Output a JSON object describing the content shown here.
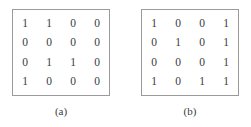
{
  "figure": {
    "panels": [
      {
        "id": "panel-a",
        "caption": "(a)",
        "matrix": [
          [
            "1",
            "1",
            "0",
            "0"
          ],
          [
            "0",
            "0",
            "0",
            "0"
          ],
          [
            "0",
            "1",
            "1",
            "0"
          ],
          [
            "1",
            "0",
            "0",
            "0"
          ]
        ]
      },
      {
        "id": "panel-b",
        "caption": "(b)",
        "matrix": [
          [
            "1",
            "0",
            "0",
            "1"
          ],
          [
            "0",
            "1",
            "0",
            "1"
          ],
          [
            "0",
            "0",
            "0",
            "1"
          ],
          [
            "1",
            "0",
            "1",
            "1"
          ]
        ]
      }
    ],
    "colors": {
      "background": "#ffffff",
      "border": "#9b9b9b",
      "text": "#3b3b3b"
    }
  }
}
